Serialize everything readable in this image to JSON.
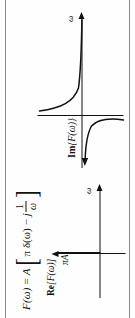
{
  "figure": {
    "equation": {
      "lhs": "F(ω)",
      "equals": "=",
      "amplitude": "A",
      "bracket_open": "[",
      "bracket_close": "]",
      "term1": "π δ(ω)",
      "operator": "−",
      "imag_unit": "j",
      "fraction_numerator": "1",
      "fraction_denominator": "ω"
    },
    "plots": [
      {
        "id": "re",
        "function_label_prefix": "Re",
        "function_label": "[F(ω)]",
        "axis_label": "ω",
        "impulse_label": "πA",
        "type": "impulse"
      },
      {
        "id": "im",
        "function_label_prefix": "Im",
        "function_label": "{F(ω)}",
        "axis_label": "ω",
        "type": "hyperbola"
      }
    ]
  },
  "colors": {
    "ink": "#111111",
    "frame": "#8b8b8b",
    "background": "#ffffff"
  }
}
